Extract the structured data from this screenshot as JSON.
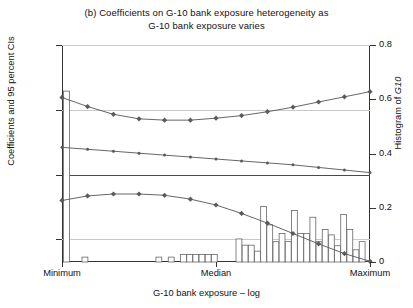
{
  "title": {
    "panel": "(b)",
    "line1": "(b)   Coefficients on G-10 bank exposure heterogeneity as",
    "line2": "G-10 bank exposure varies"
  },
  "axes": {
    "ylabel_left": "Coefficients and 95 percent CIs",
    "ylabel_right_prefix": "Histogram of ",
    "ylabel_right_italic": "G10",
    "xlabel": "G-10 bank exposure – log",
    "left_ticks": [
      "0.02",
      "0.01",
      "0",
      "–0.01"
    ],
    "left_tick_values": [
      0.02,
      0.01,
      0,
      -0.01
    ],
    "right_ticks": [
      "0.8",
      "0.6",
      "0.4",
      "0.2",
      "0"
    ],
    "right_tick_values": [
      0.8,
      0.6,
      0.4,
      0.2,
      0
    ],
    "x_ticks": [
      "Minimum",
      "Median",
      "Maximum"
    ],
    "x_tick_positions": [
      0,
      0.5,
      1
    ]
  },
  "colors": {
    "line": "#555555",
    "marker": "#5a5a5a",
    "grid": "#c9c9c9",
    "axis": "#333333",
    "zero": "#4a4a4a",
    "bar_stroke": "#666666",
    "bar_fill": "#ffffff",
    "text": "#111111"
  },
  "chart_data": {
    "type": "line",
    "title": "(b) Coefficients on G-10 bank exposure heterogeneity as G-10 bank exposure varies",
    "xlabel": "G-10 bank exposure – log",
    "ylabel": "Coefficients and 95 percent CIs",
    "ylabel_secondary": "Histogram of G10",
    "ylim": [
      -0.0135,
      0.02
    ],
    "ylim_secondary": [
      0,
      0.8
    ],
    "xlim": [
      0,
      1
    ],
    "grid": true,
    "legend": "none",
    "x": [
      0.0,
      0.083,
      0.167,
      0.25,
      0.333,
      0.417,
      0.5,
      0.583,
      0.667,
      0.75,
      0.833,
      0.917,
      1.0
    ],
    "series": [
      {
        "name": "Upper 95% CI",
        "marker": "diamond",
        "values": [
          0.0119,
          0.0105,
          0.0093,
          0.0086,
          0.0084,
          0.0084,
          0.0087,
          0.0091,
          0.0097,
          0.0104,
          0.0112,
          0.012,
          0.0128
        ]
      },
      {
        "name": "Coefficient",
        "marker": "dot",
        "values": [
          0.0042,
          0.0039,
          0.0036,
          0.0033,
          0.003,
          0.0027,
          0.0024,
          0.0021,
          0.0018,
          0.0015,
          0.0011,
          0.0007,
          0.0003
        ]
      },
      {
        "name": "Lower 95% CI",
        "marker": "diamond",
        "values": [
          -0.004,
          -0.0033,
          -0.003,
          -0.003,
          -0.0032,
          -0.0038,
          -0.0047,
          -0.006,
          -0.0075,
          -0.0091,
          -0.0107,
          -0.0122,
          -0.0134
        ]
      }
    ],
    "histogram": {
      "name": "Histogram of G10",
      "axis": "right",
      "bin_x": [
        0.005,
        0.065,
        0.305,
        0.345,
        0.385,
        0.405,
        0.425,
        0.445,
        0.465,
        0.485,
        0.565,
        0.585,
        0.605,
        0.625,
        0.645,
        0.665,
        0.685,
        0.705,
        0.725,
        0.745,
        0.765,
        0.785,
        0.805,
        0.825,
        0.845,
        0.865,
        0.885,
        0.905,
        0.925,
        0.945,
        0.965
      ],
      "bin_width": 0.019,
      "values": [
        0.63,
        0.018,
        0.018,
        0.018,
        0.028,
        0.028,
        0.028,
        0.028,
        0.028,
        0.028,
        0.085,
        0.062,
        0.062,
        0.04,
        0.205,
        0.137,
        0.075,
        0.105,
        0.075,
        0.19,
        0.105,
        0.105,
        0.165,
        0.075,
        0.12,
        0.1,
        0.06,
        0.175,
        0.12,
        0.045,
        0.075
      ]
    }
  }
}
